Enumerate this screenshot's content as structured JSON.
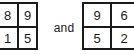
{
  "expression": {
    "conjunction": "and",
    "matrices": [
      {
        "name": "left-matrix",
        "rows": [
          [
            "8",
            "9"
          ],
          [
            "1",
            "5"
          ]
        ]
      },
      {
        "name": "right-matrix",
        "rows": [
          [
            "9",
            "6"
          ],
          [
            "5",
            "2"
          ]
        ]
      }
    ]
  },
  "colors": {
    "background": "#ffffff",
    "ink": "#1a1a1a",
    "grid_line": "#1a1a1a"
  }
}
